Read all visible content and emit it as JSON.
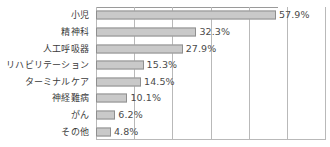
{
  "chart_data": {
    "type": "bar",
    "orientation": "horizontal",
    "title": "",
    "xlabel": "",
    "ylabel": "",
    "xlim": [
      0,
      74
    ],
    "grid": true,
    "grid_axis": "x",
    "gridline_values": [
      0,
      12.3,
      24.6,
      36.9,
      49.2,
      61.5,
      73.8
    ],
    "legend": false,
    "value_suffix": "%",
    "categories": [
      "小児",
      "精神科",
      "人工呼吸器",
      "リハビリテーション",
      "ターミナルケア",
      "神経難病",
      "がん",
      "その他"
    ],
    "values": [
      57.9,
      32.3,
      27.9,
      15.3,
      14.5,
      10.1,
      6.2,
      4.8
    ],
    "value_labels": [
      "57.9%",
      "32.3%",
      "27.9%",
      "15.3%",
      "14.5%",
      "10.1%",
      "6.2%",
      "4.8%"
    ],
    "colors": {
      "bar_fill": "#c9c9c9",
      "bar_border": "#8f8f8f",
      "gridline": "#b9b9b9",
      "axis": "#9a9a9a",
      "category_text": "#3b3b3b",
      "value_text": "#4a4a4a",
      "background": "#ffffff"
    }
  }
}
